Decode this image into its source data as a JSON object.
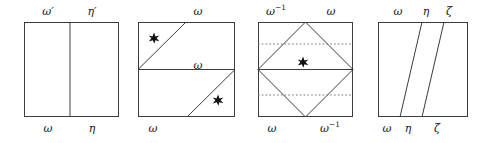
{
  "figure": {
    "background": "#ffffff",
    "line_color": "#3c3c3c",
    "dotted_color": "#777777",
    "marker_color": "#111111",
    "panel_count": 4
  },
  "panels": [
    {
      "id": "panel-1",
      "type": "square-with-vertical-midline",
      "labels_top": [
        {
          "text": "ω′",
          "name": "label-omega-prime"
        },
        {
          "text": "η′",
          "name": "label-eta-prime"
        }
      ],
      "labels_bottom": [
        {
          "text": "ω",
          "name": "label-omega"
        },
        {
          "text": "η",
          "name": "label-eta"
        }
      ],
      "labels_inner": [],
      "markers": 0
    },
    {
      "id": "panel-2",
      "type": "square-with-horizontal-midline-and-two-diagonals",
      "labels_top": [
        {
          "text": "ω",
          "name": "label-omega"
        }
      ],
      "labels_bottom": [
        {
          "text": "ω",
          "name": "label-omega"
        }
      ],
      "labels_inner": [
        {
          "text": "ω",
          "name": "label-omega-middle"
        }
      ],
      "markers": 2
    },
    {
      "id": "panel-3",
      "type": "square-with-inscribed-diamond-and-dotted-lines",
      "labels_top": [
        {
          "text": "ω",
          "sup": "−1",
          "name": "label-omega-inverse"
        },
        {
          "text": "ω",
          "name": "label-omega"
        }
      ],
      "labels_bottom": [
        {
          "text": "ω",
          "name": "label-omega"
        },
        {
          "text": "ω",
          "sup": "−1",
          "name": "label-omega-inverse"
        }
      ],
      "labels_inner": [],
      "markers": 1
    },
    {
      "id": "panel-4",
      "type": "square-with-two-slanted-lines",
      "labels_top": [
        {
          "text": "ω",
          "name": "label-omega"
        },
        {
          "text": "η",
          "name": "label-eta"
        },
        {
          "text": "ζ",
          "name": "label-zeta"
        }
      ],
      "labels_bottom": [
        {
          "text": "ω",
          "name": "label-omega"
        },
        {
          "text": "η",
          "name": "label-eta"
        },
        {
          "text": "ζ",
          "name": "label-zeta"
        }
      ],
      "labels_inner": [],
      "markers": 0
    }
  ],
  "text": {
    "p1_top_left": "ω′",
    "p1_top_right": "η′",
    "p1_bot_left": "ω",
    "p1_bot_right": "η",
    "p2_top": "ω",
    "p2_mid": "ω",
    "p2_bot": "ω",
    "p3_top_left": "ω",
    "p3_top_left_sup": "−1",
    "p3_top_right": "ω",
    "p3_bot_left": "ω",
    "p3_bot_right": "ω",
    "p3_bot_right_sup": "−1",
    "p4_top_omega": "ω",
    "p4_top_eta": "η",
    "p4_top_zeta": "ζ",
    "p4_bot_omega": "ω",
    "p4_bot_eta": "η",
    "p4_bot_zeta": "ζ"
  }
}
